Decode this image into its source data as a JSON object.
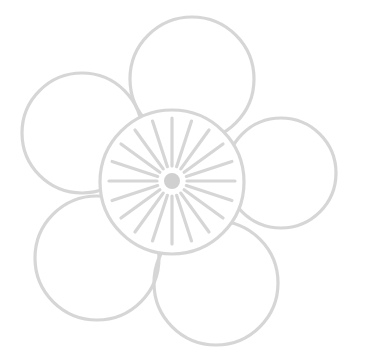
{
  "diagram": {
    "title": "",
    "type": "flower-line-icon",
    "colors": {
      "stroke": "#d6d6d6",
      "center_dot": "#d0d0d0",
      "background": "#ffffff"
    },
    "stroke_width": 3.2,
    "petals": [
      {
        "name": "petal-top",
        "cx": 192,
        "cy": 79,
        "r": 62
      },
      {
        "name": "petal-left",
        "cx": 82,
        "cy": 133,
        "r": 60
      },
      {
        "name": "petal-right",
        "cx": 281,
        "cy": 173,
        "r": 55
      },
      {
        "name": "petal-bottom-left",
        "cx": 97,
        "cy": 258,
        "r": 62
      },
      {
        "name": "petal-bottom-right",
        "cx": 216,
        "cy": 283,
        "r": 62
      }
    ],
    "center_disc": {
      "cx": 172,
      "cy": 182,
      "r": 72
    },
    "center_dot": {
      "cx": 172,
      "cy": 181,
      "r": 9
    },
    "rays": {
      "count": 20,
      "inner_r": 15,
      "outer_r": 63,
      "start_angle_deg": 0
    }
  }
}
